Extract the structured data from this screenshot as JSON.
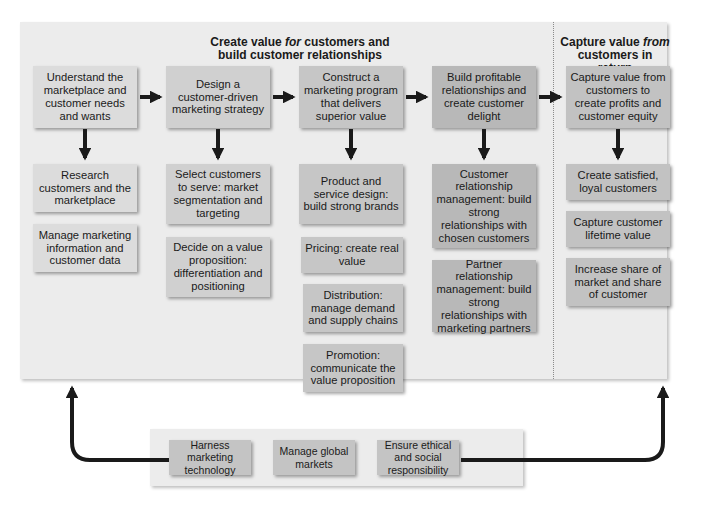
{
  "headings": {
    "create_value_line1_pre": "Create value ",
    "create_value_line1_em": "for",
    "create_value_line1_post": " customers and",
    "create_value_line2": "build customer relationships",
    "capture_value_line1_pre": "Capture value ",
    "capture_value_line1_em": "from",
    "capture_value_line2": "customers in return"
  },
  "steps": [
    {
      "label": "Understand the marketplace and customer needs and wants",
      "subs": [
        "Research customers and the marketplace",
        "Manage marketing information and customer data"
      ]
    },
    {
      "label": "Design a customer-driven marketing strategy",
      "subs": [
        "Select customers to serve: market segmentation and targeting",
        "Decide on a value proposition: differentiation and positioning"
      ]
    },
    {
      "label": "Construct a marketing program that delivers superior value",
      "subs": [
        "Product and service design: build strong brands",
        "Pricing: create real value",
        "Distribution: manage demand and supply chains",
        "Promotion: communicate the value proposition"
      ]
    },
    {
      "label": "Build profitable relationships and create customer delight",
      "subs": [
        "Customer relationship management: build strong relationships with chosen customers",
        "Partner relationship management: build strong relationships with marketing partners"
      ]
    },
    {
      "label": "Capture value from customers to create profits and customer equity",
      "subs": [
        "Create satisfied, loyal customers",
        "Capture customer lifetime value",
        "Increase share of market and share of customer"
      ]
    }
  ],
  "bottom": [
    "Harness marketing technology",
    "Manage global markets",
    "Ensure ethical and social responsibility"
  ],
  "colors": {
    "panel": "#ececec",
    "arrow": "#1a1a1a",
    "divider": "#8a8a8a"
  }
}
